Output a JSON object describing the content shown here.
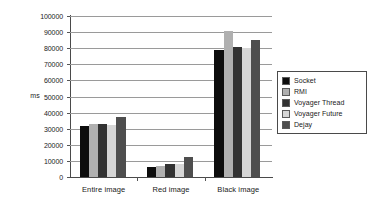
{
  "chart_data": {
    "type": "bar",
    "title": "",
    "xlabel": "",
    "ylabel": "ms",
    "ylim": [
      0,
      100000
    ],
    "ytick_step": 10000,
    "yticks": [
      "0",
      "10000",
      "20000",
      "30000",
      "40000",
      "50000",
      "60000",
      "70000",
      "80000",
      "90000",
      "100000"
    ],
    "grid": true,
    "legend_position": "right",
    "categories": [
      "Entire image",
      "Red image",
      "Black image"
    ],
    "series": [
      {
        "name": "Socket",
        "color": "#0d0d0d",
        "values": [
          31800,
          6200,
          79100
        ]
      },
      {
        "name": "RMI",
        "color": "#b0b0b0",
        "values": [
          32700,
          7000,
          90800
        ]
      },
      {
        "name": "Voyager Thread",
        "color": "#323232",
        "values": [
          32700,
          8300,
          81000
        ]
      },
      {
        "name": "Voyager Future",
        "color": "#d6d6d6",
        "values": [
          32000,
          8200,
          79900
        ]
      },
      {
        "name": "Dejay",
        "color": "#4e4e4e",
        "values": [
          37100,
          12200,
          85300
        ]
      }
    ]
  },
  "legend": {
    "items": [
      {
        "label": "Socket"
      },
      {
        "label": "RMI"
      },
      {
        "label": "Voyager Thread"
      },
      {
        "label": "Voyager Future"
      },
      {
        "label": "Dejay"
      }
    ]
  },
  "axis": {
    "y_title": "ms"
  },
  "colors": {
    "gridline": "#9a9a9a",
    "axis": "#4a4a4a",
    "background": "#ffffff",
    "text": "#1a1a1a"
  }
}
